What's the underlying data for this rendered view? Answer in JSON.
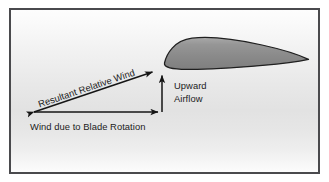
{
  "figure": {
    "frame_color": "#4a4a4d",
    "background_top_color": "#fdfdfd",
    "background_mid_color": "#e2e2e2",
    "background_bottom_color": "#fcfcfc"
  },
  "airfoil": {
    "name": "airfoil-cross-section",
    "fill_color": "#8d8d8d",
    "fill_highlight_color": "#a6a6a6",
    "outline_color": "#1f1f1f"
  },
  "vectors": {
    "resultant": {
      "label": "Resultant Relative Wind",
      "color": "#151515",
      "rotation_deg": -22.5,
      "double_headed": true
    },
    "rotation": {
      "label": "Wind due to Blade Rotation",
      "color": "#151515",
      "direction": "horizontal-right"
    },
    "upward": {
      "label_line1": "Upward",
      "label_line2": "Airflow",
      "color": "#151515",
      "direction": "vertical-up"
    }
  }
}
